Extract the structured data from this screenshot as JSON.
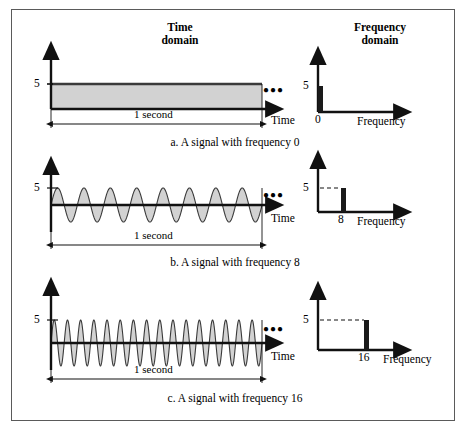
{
  "figure": {
    "headers": {
      "time_domain": "Time\ndomain",
      "frequency_domain": "Frequency\ndomain"
    },
    "colors": {
      "wave_fill": "#d2d2d2",
      "wave_stroke": "#3a3a3a",
      "axis": "#111111",
      "frame_border": "#5a5a5a",
      "dashed_guide": "#111111",
      "background": "#ffffff"
    },
    "rows": [
      {
        "id": "row-a",
        "caption": "a. A signal with frequency 0",
        "time": {
          "amplitude_label": "5",
          "duration_label": "1 second",
          "x_axis_label": "Time",
          "ellipsis": "●●●",
          "cycles": 0,
          "waveform": "dc-constant"
        },
        "frequency": {
          "amplitude_label": "5",
          "x_axis_label": "Frequency",
          "peak_tick_label": "0",
          "peak_frequency": 0,
          "peak_amplitude": 5,
          "has_dashed_guide": false
        }
      },
      {
        "id": "row-b",
        "caption": "b. A signal with frequency 8",
        "time": {
          "amplitude_label": "5",
          "duration_label": "1 second",
          "x_axis_label": "Time",
          "ellipsis": "●●●",
          "cycles": 8,
          "waveform": "sine"
        },
        "frequency": {
          "amplitude_label": "5",
          "x_axis_label": "Frequency",
          "peak_tick_label": "8",
          "peak_frequency": 8,
          "peak_amplitude": 5,
          "has_dashed_guide": true
        }
      },
      {
        "id": "row-c",
        "caption": "c. A signal with frequency 16",
        "time": {
          "amplitude_label": "5",
          "duration_label": "1 second",
          "x_axis_label": "Time",
          "ellipsis": "●●●",
          "cycles": 16,
          "waveform": "sine"
        },
        "frequency": {
          "amplitude_label": "5",
          "x_axis_label": "Frequency",
          "peak_tick_label": "16",
          "peak_frequency": 16,
          "peak_amplitude": 5,
          "has_dashed_guide": true
        }
      }
    ]
  },
  "chart_data": {
    "type": "line",
    "panels": [
      {
        "name": "a-time",
        "type": "area",
        "title": "Time domain",
        "xlabel": "Time",
        "ylabel": "",
        "ylim": [
          0,
          5
        ],
        "xlim": [
          0,
          1
        ],
        "annotations": [
          "5",
          "1 second"
        ],
        "series": [
          {
            "name": "DC signal, frequency 0",
            "amplitude": 5,
            "frequency": 0
          }
        ]
      },
      {
        "name": "a-frequency",
        "type": "bar",
        "title": "Frequency domain",
        "xlabel": "Frequency",
        "ylabel": "",
        "categories": [
          "0"
        ],
        "values": [
          5
        ],
        "ylim": [
          0,
          5
        ]
      },
      {
        "name": "b-time",
        "type": "area",
        "title": "Time domain",
        "xlabel": "Time",
        "ylabel": "",
        "ylim": [
          -5,
          5
        ],
        "xlim": [
          0,
          1
        ],
        "annotations": [
          "5",
          "1 second"
        ],
        "series": [
          {
            "name": "Sine signal, frequency 8",
            "amplitude": 5,
            "frequency": 8
          }
        ]
      },
      {
        "name": "b-frequency",
        "type": "bar",
        "title": "Frequency domain",
        "xlabel": "Frequency",
        "ylabel": "",
        "categories": [
          "8"
        ],
        "values": [
          5
        ],
        "ylim": [
          0,
          5
        ]
      },
      {
        "name": "c-time",
        "type": "area",
        "title": "Time domain",
        "xlabel": "Time",
        "ylabel": "",
        "ylim": [
          -5,
          5
        ],
        "xlim": [
          0,
          1
        ],
        "annotations": [
          "5",
          "1 second"
        ],
        "series": [
          {
            "name": "Sine signal, frequency 16",
            "amplitude": 5,
            "frequency": 16
          }
        ]
      },
      {
        "name": "c-frequency",
        "type": "bar",
        "title": "Frequency domain",
        "xlabel": "Frequency",
        "ylabel": "",
        "categories": [
          "16"
        ],
        "values": [
          5
        ],
        "ylim": [
          0,
          5
        ]
      }
    ],
    "grid": false,
    "legend": "none"
  }
}
